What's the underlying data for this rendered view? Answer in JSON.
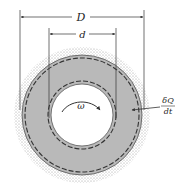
{
  "diagram": {
    "type": "annular cylinder cross-section (heat conduction / rotating shaft)",
    "labels": {
      "outer_diameter": "D",
      "inner_diameter": "d",
      "angular_velocity": "ω",
      "heat_rate_numerator": "δQ",
      "heat_rate_denominator": "dt"
    },
    "colors": {
      "annulus_fill": "#b9b9b9",
      "stipple": "#9a9a9a",
      "lines": "#333333",
      "background": "#ffffff"
    }
  }
}
